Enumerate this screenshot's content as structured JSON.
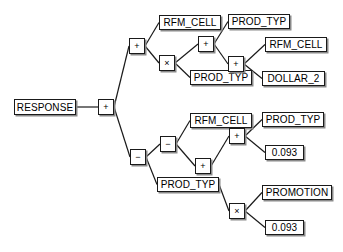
{
  "diagram": {
    "type": "expression-tree",
    "stroke_color": "#1a1a1a",
    "shadow_color": "#8a8a8a",
    "background_color": "#ffffff",
    "nodes": [
      {
        "id": "response",
        "label": "RESPONSE",
        "kind": "variable",
        "x": 14,
        "y": 99,
        "w": 62
      },
      {
        "id": "root_plus",
        "label": "+",
        "kind": "operator",
        "x": 98,
        "y": 99
      },
      {
        "id": "op_plus_a",
        "label": "+",
        "kind": "operator",
        "x": 129,
        "y": 38
      },
      {
        "id": "var_rfm_1",
        "label": "RFM_CELL",
        "kind": "variable",
        "x": 159,
        "y": 15,
        "w": 62
      },
      {
        "id": "op_mult_a",
        "label": "×",
        "kind": "operator",
        "x": 159,
        "y": 55
      },
      {
        "id": "op_plus_b",
        "label": "+",
        "kind": "operator",
        "x": 198,
        "y": 36
      },
      {
        "id": "var_prod_1",
        "label": "PROD_TYP",
        "kind": "variable",
        "x": 228,
        "y": 14,
        "w": 62
      },
      {
        "id": "var_prod_2",
        "label": "PROD_TYP",
        "kind": "variable",
        "x": 190,
        "y": 70,
        "w": 62
      },
      {
        "id": "op_plus_c",
        "label": "+",
        "kind": "operator",
        "x": 228,
        "y": 56
      },
      {
        "id": "var_rfm_2",
        "label": "RFM_CELL",
        "kind": "variable",
        "x": 265,
        "y": 37,
        "w": 62
      },
      {
        "id": "var_dollar",
        "label": "DOLLAR_2",
        "kind": "variable",
        "x": 262,
        "y": 71,
        "w": 63
      },
      {
        "id": "op_minus_a",
        "label": "−",
        "kind": "operator",
        "x": 130,
        "y": 149
      },
      {
        "id": "op_minus_b",
        "label": "−",
        "kind": "operator",
        "x": 160,
        "y": 136
      },
      {
        "id": "var_rfm_3",
        "label": "RFM_CELL",
        "kind": "variable",
        "x": 190,
        "y": 113,
        "w": 62
      },
      {
        "id": "op_plus_d",
        "label": "+",
        "kind": "operator",
        "x": 195,
        "y": 158
      },
      {
        "id": "op_plus_e",
        "label": "+",
        "kind": "operator",
        "x": 229,
        "y": 128
      },
      {
        "id": "var_prod_3",
        "label": "PROD_TYP",
        "kind": "variable",
        "x": 262,
        "y": 112,
        "w": 62
      },
      {
        "id": "num_093_a",
        "label": "0.093",
        "kind": "number",
        "x": 265,
        "y": 145,
        "w": 39
      },
      {
        "id": "var_prod_4",
        "label": "PROD_TYP",
        "kind": "variable",
        "x": 157,
        "y": 177,
        "w": 62
      },
      {
        "id": "op_mult_b",
        "label": "×",
        "kind": "operator",
        "x": 229,
        "y": 203
      },
      {
        "id": "var_promo",
        "label": "PROMOTION",
        "kind": "variable",
        "x": 262,
        "y": 185,
        "w": 70
      },
      {
        "id": "num_093_b",
        "label": "0.093",
        "kind": "number",
        "x": 265,
        "y": 220,
        "w": 39
      }
    ],
    "edges": [
      {
        "from": "response",
        "to": "root_plus"
      },
      {
        "from": "root_plus",
        "to": "op_plus_a"
      },
      {
        "from": "root_plus",
        "to": "op_minus_a"
      },
      {
        "from": "op_plus_a",
        "to": "var_rfm_1"
      },
      {
        "from": "op_plus_a",
        "to": "op_mult_a"
      },
      {
        "from": "op_mult_a",
        "to": "op_plus_b"
      },
      {
        "from": "op_mult_a",
        "to": "var_prod_2"
      },
      {
        "from": "op_plus_b",
        "to": "var_prod_1"
      },
      {
        "from": "op_plus_b",
        "to": "op_plus_c"
      },
      {
        "from": "op_plus_c",
        "to": "var_rfm_2"
      },
      {
        "from": "op_plus_c",
        "to": "var_dollar"
      },
      {
        "from": "op_minus_a",
        "to": "op_minus_b"
      },
      {
        "from": "op_minus_a",
        "to": "var_prod_4"
      },
      {
        "from": "op_minus_b",
        "to": "var_rfm_3"
      },
      {
        "from": "op_minus_b",
        "to": "op_plus_d"
      },
      {
        "from": "op_plus_d",
        "to": "op_plus_e"
      },
      {
        "from": "op_plus_e",
        "to": "var_prod_3"
      },
      {
        "from": "op_plus_e",
        "to": "num_093_a"
      },
      {
        "from": "var_prod_4",
        "to": "op_mult_b"
      },
      {
        "from": "op_mult_b",
        "to": "var_promo"
      },
      {
        "from": "op_mult_b",
        "to": "num_093_b"
      }
    ]
  }
}
